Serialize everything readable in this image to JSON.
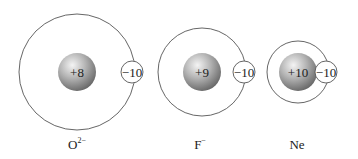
{
  "diagram": {
    "species": [
      {
        "name": "O",
        "charge_superscript": "2−",
        "nuclear_charge": "+8",
        "electron_charge": "−10",
        "center_x": 77,
        "outer_radius": 58
      },
      {
        "name": "F",
        "charge_superscript": "−",
        "nuclear_charge": "+9",
        "electron_charge": "−10",
        "center_x": 202,
        "outer_radius": 44
      },
      {
        "name": "Ne",
        "charge_superscript": "",
        "nuclear_charge": "+10",
        "electron_charge": "−10",
        "center_x": 298,
        "outer_radius": 31
      }
    ],
    "colors": {
      "outline": "#555555",
      "nucleus_light": "#f2f2f2",
      "nucleus_dark": "#6e6e6e",
      "background": "#ffffff"
    }
  }
}
